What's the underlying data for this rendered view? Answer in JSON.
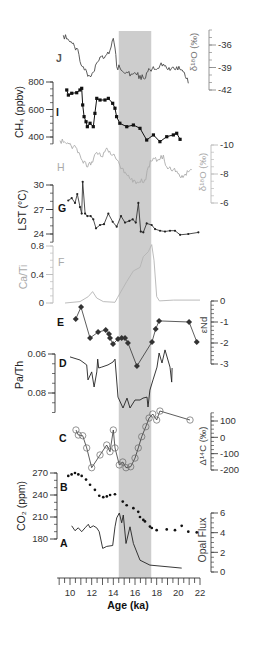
{
  "chart_data": {
    "type": "line",
    "title": "",
    "xlabel": "Age (ka)",
    "xlim": [
      9,
      22
    ],
    "x_ticks": [
      10,
      12,
      14,
      16,
      18,
      20,
      22
    ],
    "shaded_interval": [
      14.5,
      17.5
    ],
    "grid": false,
    "legend": null,
    "panels": [
      {
        "id": "J",
        "letter": "J",
        "ylabel": "δ¹⁸O (‰)",
        "axis_side": "right",
        "y_ticks": [
          -36,
          -39,
          -42
        ],
        "ylim": [
          -42,
          -34
        ],
        "marker": "none",
        "points": [
          [
            9.38,
            -34.7
          ],
          [
            10.0,
            -35.6
          ],
          [
            10.62,
            -36.4
          ],
          [
            10.92,
            -38.2
          ],
          [
            11.23,
            -38.9
          ],
          [
            11.54,
            -39.6
          ],
          [
            11.85,
            -40.2
          ],
          [
            12.15,
            -39.6
          ],
          [
            12.46,
            -38.4
          ],
          [
            12.77,
            -37.6
          ],
          [
            13.07,
            -37.8
          ],
          [
            13.39,
            -37.3
          ],
          [
            13.69,
            -36.7
          ],
          [
            14.0,
            -35.1
          ],
          [
            14.15,
            -36.4
          ],
          [
            14.31,
            -38.9
          ],
          [
            15.23,
            -39.6
          ],
          [
            16.16,
            -40.0
          ],
          [
            16.77,
            -40.4
          ],
          [
            17.38,
            -39.3
          ],
          [
            18.31,
            -38.7
          ],
          [
            18.93,
            -39.1
          ],
          [
            19.85,
            -38.9
          ],
          [
            20.46,
            -39.6
          ],
          [
            20.92,
            -41.1
          ]
        ]
      },
      {
        "id": "I",
        "letter": "I",
        "ylabel": "CH₄ (ppbv)",
        "axis_side": "left",
        "y_ticks": [
          800,
          600,
          400
        ],
        "ylim": [
          350,
          800
        ],
        "marker": "square",
        "points": [
          [
            9.7,
            742
          ],
          [
            9.85,
            705
          ],
          [
            10.16,
            718
          ],
          [
            10.62,
            722
          ],
          [
            10.92,
            742
          ],
          [
            11.08,
            754
          ],
          [
            11.17,
            633
          ],
          [
            11.3,
            548
          ],
          [
            11.48,
            511
          ],
          [
            11.6,
            475
          ],
          [
            11.85,
            500
          ],
          [
            12.15,
            475
          ],
          [
            12.3,
            572
          ],
          [
            12.47,
            681
          ],
          [
            12.77,
            669
          ],
          [
            13.23,
            669
          ],
          [
            13.54,
            681
          ],
          [
            13.94,
            645
          ],
          [
            14.15,
            609
          ],
          [
            14.3,
            548
          ],
          [
            14.6,
            500
          ],
          [
            15.24,
            475
          ],
          [
            15.85,
            487
          ],
          [
            16.46,
            463
          ],
          [
            17.08,
            378
          ],
          [
            17.7,
            415
          ],
          [
            18.3,
            366
          ],
          [
            18.93,
            402
          ],
          [
            19.54,
            415
          ],
          [
            19.85,
            427
          ],
          [
            20.16,
            383
          ]
        ]
      },
      {
        "id": "H",
        "letter": "H",
        "ylabel": "δ¹⁸O (‰)",
        "axis_side": "right",
        "y_ticks": [
          -10,
          -8,
          -6
        ],
        "ylim": [
          -10,
          -6
        ],
        "marker": "none",
        "points": [
          [
            9.08,
            -10.3
          ],
          [
            9.7,
            -10.1
          ],
          [
            10.31,
            -9.9
          ],
          [
            10.92,
            -9.3
          ],
          [
            11.54,
            -8.5
          ],
          [
            12.0,
            -8.85
          ],
          [
            12.46,
            -9.5
          ],
          [
            12.93,
            -9.2
          ],
          [
            13.39,
            -9.8
          ],
          [
            13.85,
            -9.3
          ],
          [
            14.15,
            -9.2
          ],
          [
            14.8,
            -8.4
          ],
          [
            15.5,
            -7.7
          ],
          [
            16.3,
            -7.4
          ],
          [
            17.0,
            -7.6
          ],
          [
            17.23,
            -8.5
          ],
          [
            17.69,
            -9.1
          ],
          [
            18.31,
            -9.0
          ],
          [
            18.62,
            -9.3
          ],
          [
            18.93,
            -8.5
          ],
          [
            19.54,
            -8.3
          ],
          [
            20.15,
            -7.8
          ],
          [
            20.62,
            -8.0
          ],
          [
            21.23,
            -8.3
          ]
        ]
      },
      {
        "id": "G",
        "letter": "G",
        "ylabel": "LST (°C)",
        "axis_side": "left",
        "y_ticks": [
          30,
          27,
          24
        ],
        "ylim": [
          23,
          30
        ],
        "marker": "dot",
        "points": [
          [
            9.84,
            28.1
          ],
          [
            10.16,
            28.4
          ],
          [
            10.46,
            27.8
          ],
          [
            10.67,
            28.9
          ],
          [
            10.92,
            27.3
          ],
          [
            11.08,
            26.5
          ],
          [
            11.17,
            30.4
          ],
          [
            11.39,
            26.5
          ],
          [
            11.6,
            26.2
          ],
          [
            11.91,
            26.2
          ],
          [
            12.15,
            25.8
          ],
          [
            12.4,
            24.7
          ],
          [
            12.77,
            25.1
          ],
          [
            13.14,
            25.2
          ],
          [
            13.54,
            26.5
          ],
          [
            13.94,
            25.5
          ],
          [
            14.31,
            24.9
          ],
          [
            14.71,
            26.2
          ],
          [
            15.08,
            25.4
          ],
          [
            15.48,
            25.6
          ],
          [
            15.79,
            25.8
          ],
          [
            16.07,
            25.4
          ],
          [
            16.31,
            27.8
          ],
          [
            16.53,
            24.3
          ],
          [
            16.77,
            24.2
          ],
          [
            17.08,
            25.3
          ],
          [
            17.54,
            25.1
          ],
          [
            17.85,
            24.6
          ],
          [
            18.31,
            24.4
          ],
          [
            18.77,
            24.3
          ],
          [
            19.23,
            24.4
          ],
          [
            19.69,
            24.4
          ],
          [
            20.16,
            23.9
          ],
          [
            20.92,
            24.0
          ],
          [
            21.85,
            24.2
          ]
        ]
      },
      {
        "id": "F",
        "letter": "F",
        "ylabel": "Ca/Ti",
        "axis_side": "left",
        "y_ticks": [
          0.8,
          0.4,
          0
        ],
        "ylim": [
          0,
          0.8
        ],
        "marker": "none",
        "points": [
          [
            9.54,
            0.0
          ],
          [
            10.92,
            0.02
          ],
          [
            11.69,
            0.09
          ],
          [
            12.09,
            0.16
          ],
          [
            12.46,
            0.07
          ],
          [
            13.07,
            0.02
          ],
          [
            14.15,
            0.01
          ],
          [
            14.4,
            0.08
          ],
          [
            15.23,
            0.3
          ],
          [
            15.85,
            0.45
          ],
          [
            16.46,
            0.5
          ],
          [
            16.77,
            0.65
          ],
          [
            17.23,
            0.72
          ],
          [
            17.54,
            0.82
          ],
          [
            17.75,
            0.6
          ],
          [
            18.0,
            0.09
          ],
          [
            18.25,
            0.03
          ],
          [
            19.54,
            0.04
          ],
          [
            22.0,
            0.04
          ]
        ]
      },
      {
        "id": "E",
        "letter": "E",
        "ylabel": "εNd",
        "axis_side": "right",
        "y_ticks": [
          0,
          -1,
          -2,
          -3
        ],
        "ylim": [
          -3,
          0
        ],
        "marker": "diamond",
        "points": [
          [
            10.53,
            -0.86
          ],
          [
            11.02,
            -0.29
          ],
          [
            11.85,
            -1.76
          ],
          [
            12.59,
            -1.48
          ],
          [
            13.3,
            -1.38
          ],
          [
            13.6,
            -1.57
          ],
          [
            13.69,
            -1.76
          ],
          [
            13.97,
            -2.05
          ],
          [
            14.43,
            -1.81
          ],
          [
            14.77,
            -1.76
          ],
          [
            15.08,
            -1.76
          ],
          [
            15.35,
            -2.0
          ],
          [
            16.18,
            -3.1
          ],
          [
            17.57,
            -1.95
          ],
          [
            17.91,
            -1.33
          ],
          [
            18.22,
            -0.95
          ],
          [
            20.99,
            -1.0
          ],
          [
            21.7,
            -1.95
          ]
        ]
      },
      {
        "id": "D",
        "letter": "D",
        "ylabel": "Pa/Th",
        "axis_side": "left",
        "y_ticks": [
          0.06,
          0.08
        ],
        "ylim": [
          0.06,
          0.09
        ],
        "marker": "none",
        "points": [
          [
            10.0,
            0.0615
          ],
          [
            10.92,
            0.0631
          ],
          [
            11.54,
            0.0656
          ],
          [
            11.66,
            0.0733
          ],
          [
            12.0,
            0.0692
          ],
          [
            12.22,
            0.0769
          ],
          [
            12.47,
            0.0692
          ],
          [
            12.56,
            0.0626
          ],
          [
            12.65,
            0.0672
          ],
          [
            12.93,
            0.0667
          ],
          [
            13.51,
            0.0656
          ],
          [
            13.97,
            0.0641
          ],
          [
            14.15,
            0.0626
          ],
          [
            14.43,
            0.0821
          ],
          [
            14.89,
            0.0877
          ],
          [
            15.26,
            0.0826
          ],
          [
            15.54,
            0.0877
          ],
          [
            16.0,
            0.0836
          ],
          [
            16.46,
            0.0836
          ],
          [
            16.74,
            0.0826
          ],
          [
            17.11,
            0.0821
          ],
          [
            17.2,
            0.0872
          ],
          [
            17.38,
            0.0785
          ],
          [
            17.66,
            0.0733
          ],
          [
            18.03,
            0.0667
          ],
          [
            18.22,
            0.0595
          ],
          [
            18.49,
            0.0646
          ],
          [
            18.77,
            0.0579
          ],
          [
            19.23,
            0.0667
          ],
          [
            19.39,
            0.0744
          ],
          [
            19.42,
            0.0672
          ]
        ]
      },
      {
        "id": "C",
        "letter": "C",
        "ylabel": "Δ¹⁴C (‰)",
        "axis_side": "right",
        "y_ticks": [
          100,
          0,
          -100,
          -200
        ],
        "ylim": [
          -200,
          150
        ],
        "marker": "circle-open",
        "points": [
          [
            10.55,
            45
          ],
          [
            10.77,
            14
          ],
          [
            11.17,
            10
          ],
          [
            11.54,
            -65
          ],
          [
            12.0,
            -186
          ],
          [
            12.77,
            -108
          ],
          [
            13.39,
            -47
          ],
          [
            13.69,
            -88
          ],
          [
            14.0,
            45
          ],
          [
            14.15,
            -65
          ],
          [
            14.55,
            -169
          ],
          [
            14.87,
            -151
          ],
          [
            15.17,
            -186
          ],
          [
            15.6,
            -180
          ],
          [
            16.0,
            -127
          ],
          [
            16.3,
            -65
          ],
          [
            16.62,
            4
          ],
          [
            17.0,
            65
          ],
          [
            17.3,
            118
          ],
          [
            17.64,
            143
          ],
          [
            18.0,
            106
          ],
          [
            18.3,
            161
          ],
          [
            21.08,
            106
          ]
        ]
      },
      {
        "id": "B",
        "letter": "B",
        "ylabel": "CO₂ (ppm)",
        "axis_side": "left",
        "y_ticks": [
          270,
          240,
          210,
          180
        ],
        "ylim": [
          180,
          270
        ],
        "marker": "dot-only",
        "points": [
          [
            9.84,
            266
          ],
          [
            10.15,
            268
          ],
          [
            10.46,
            270
          ],
          [
            10.77,
            268
          ],
          [
            11.08,
            266
          ],
          [
            11.48,
            261
          ],
          [
            11.85,
            254
          ],
          [
            12.3,
            247
          ],
          [
            12.7,
            239
          ],
          [
            13.07,
            237
          ],
          [
            13.4,
            238
          ],
          [
            13.7,
            240
          ],
          [
            14.15,
            241
          ],
          [
            14.87,
            231
          ],
          [
            15.23,
            226
          ],
          [
            15.85,
            222
          ],
          [
            16.3,
            217
          ],
          [
            16.46,
            210
          ],
          [
            16.77,
            206
          ],
          [
            16.92,
            204
          ],
          [
            17.38,
            197
          ],
          [
            17.55,
            195
          ],
          [
            18.0,
            192
          ],
          [
            18.93,
            193
          ],
          [
            19.69,
            192
          ],
          [
            20.31,
            198
          ],
          [
            20.92,
            190
          ],
          [
            21.7,
            189
          ]
        ]
      },
      {
        "id": "A",
        "letter": "A",
        "ylabel": "Opal Flux",
        "axis_side": "right",
        "y_ticks": [
          6,
          4,
          2,
          0
        ],
        "ylim": [
          0,
          6
        ],
        "marker": "none",
        "points": [
          [
            10.16,
            4.7
          ],
          [
            10.46,
            4.2
          ],
          [
            10.77,
            4.5
          ],
          [
            11.08,
            4.1
          ],
          [
            11.39,
            4.5
          ],
          [
            11.69,
            4.85
          ],
          [
            11.85,
            4.5
          ],
          [
            12.15,
            4.7
          ],
          [
            12.46,
            4.5
          ],
          [
            12.7,
            4.1
          ],
          [
            13.02,
            2.4
          ],
          [
            13.39,
            2.6
          ],
          [
            13.94,
            2.7
          ],
          [
            14.15,
            4.6
          ],
          [
            14.31,
            5.5
          ],
          [
            14.55,
            6.0
          ],
          [
            14.77,
            5.0
          ],
          [
            14.92,
            5.8
          ],
          [
            15.17,
            2.9
          ],
          [
            15.54,
            4.6
          ],
          [
            15.85,
            2.9
          ],
          [
            16.46,
            1.2
          ],
          [
            17.38,
            0.7
          ],
          [
            20.31,
            0.4
          ]
        ]
      }
    ]
  }
}
